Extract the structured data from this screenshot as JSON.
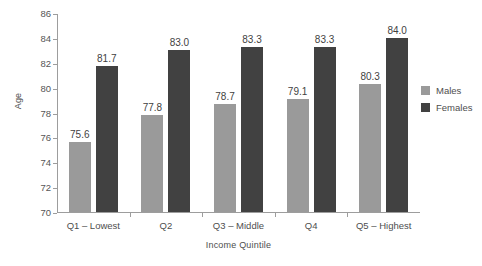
{
  "chart_data": {
    "type": "bar",
    "title": "",
    "subtitle": "",
    "xlabel": "Income Quintile",
    "ylabel": "Age",
    "categories": [
      "Q1 – Lowest",
      "Q2",
      "Q3 – Middle",
      "Q4",
      "Q5 – Highest"
    ],
    "series": [
      {
        "name": "Males",
        "color": "#9a9a9a",
        "values": [
          75.6,
          77.8,
          78.7,
          79.1,
          80.3
        ],
        "labels": [
          "75.6",
          "77.8",
          "78.7",
          "79.1",
          "80.3"
        ]
      },
      {
        "name": "Females",
        "color": "#414141",
        "values": [
          81.7,
          83.0,
          83.3,
          83.3,
          84.0
        ],
        "labels": [
          "81.7",
          "83.0",
          "83.3",
          "83.3",
          "84.0"
        ]
      }
    ],
    "ylim": [
      70,
      86
    ],
    "yticks": [
      70,
      72,
      74,
      76,
      78,
      80,
      82,
      84,
      86
    ],
    "ytick_labels": [
      "70",
      "72",
      "74",
      "76",
      "78",
      "80",
      "82",
      "84",
      "86"
    ],
    "grid": false,
    "legend_position": "right",
    "background_color": "#ffffff",
    "axis_color": "#9d9d9d",
    "text_color": "#4e4e4e"
  },
  "legend": {
    "items": [
      {
        "label": "Males",
        "color": "#9a9a9a"
      },
      {
        "label": "Females",
        "color": "#414141"
      }
    ]
  },
  "axes": {
    "y_title": "Age",
    "x_title": "Income Quintile"
  }
}
